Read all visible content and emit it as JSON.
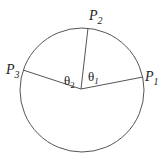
{
  "diagram": {
    "type": "circle-with-radii",
    "points": [
      {
        "id": "P1",
        "label": "P",
        "sub": "1"
      },
      {
        "id": "P2",
        "label": "P",
        "sub": "2"
      },
      {
        "id": "P3",
        "label": "P",
        "sub": "3"
      }
    ],
    "angles": [
      {
        "id": "theta1",
        "label": "θ",
        "sub": "1"
      },
      {
        "id": "theta2",
        "label": "θ",
        "sub": "2"
      }
    ],
    "colors": {
      "stroke": "#555555",
      "text": "#222222",
      "background": "#ffffff"
    }
  }
}
